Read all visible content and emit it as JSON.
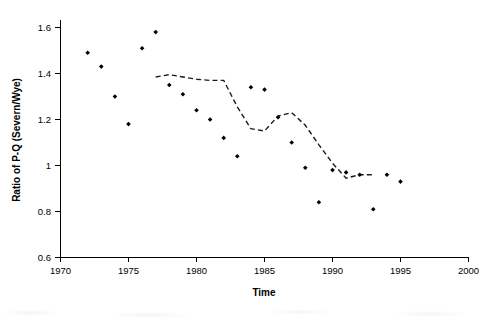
{
  "chart_data": {
    "type": "scatter",
    "title": "",
    "xlabel": "Time",
    "ylabel": "Ratio of P-Q (Severn/Wye)",
    "xlim": [
      1970,
      2000
    ],
    "ylim": [
      0.6,
      1.6
    ],
    "xticks": [
      1970,
      1975,
      1980,
      1985,
      1990,
      1995,
      2000
    ],
    "xtick_labels": [
      "1970",
      "1975",
      "1980",
      "1985",
      "1990",
      "1995",
      "2000"
    ],
    "yticks": [
      0.6,
      0.8,
      1.0,
      1.2,
      1.4,
      1.6
    ],
    "ytick_labels": [
      "0.6",
      "0.8",
      "1",
      "1.2",
      "1.4",
      "1.6"
    ],
    "grid": false,
    "legend": null,
    "marker_color": "#000000",
    "trend_color": "#1a1a1a",
    "series": [
      {
        "name": "Annual ratio of P-Q (Severn/Wye)",
        "marker": "filled-diamond",
        "x": [
          1972,
          1973,
          1974,
          1975,
          1976,
          1977,
          1978,
          1979,
          1980,
          1981,
          1982,
          1983,
          1984,
          1985,
          1986,
          1987,
          1988,
          1989,
          1990,
          1991,
          1992,
          1993,
          1994,
          1995
        ],
        "y": [
          1.49,
          1.43,
          1.3,
          1.18,
          1.51,
          1.58,
          1.35,
          1.31,
          1.24,
          1.2,
          1.12,
          1.04,
          1.34,
          1.33,
          1.21,
          1.1,
          0.99,
          0.84,
          0.98,
          0.97,
          0.96,
          0.81,
          0.96,
          0.93
        ]
      }
    ],
    "trend": {
      "name": "Smoothed trend (dashed)",
      "style": "dashed",
      "x": [
        1977,
        1978,
        1979,
        1980,
        1981,
        1982,
        1983,
        1984,
        1985,
        1986,
        1987,
        1988,
        1989,
        1990,
        1991,
        1992,
        1993
      ],
      "y": [
        1.385,
        1.395,
        1.385,
        1.375,
        1.37,
        1.37,
        1.255,
        1.16,
        1.15,
        1.215,
        1.23,
        1.175,
        1.09,
        1.01,
        0.945,
        0.96,
        0.96
      ]
    },
    "annotations": []
  }
}
